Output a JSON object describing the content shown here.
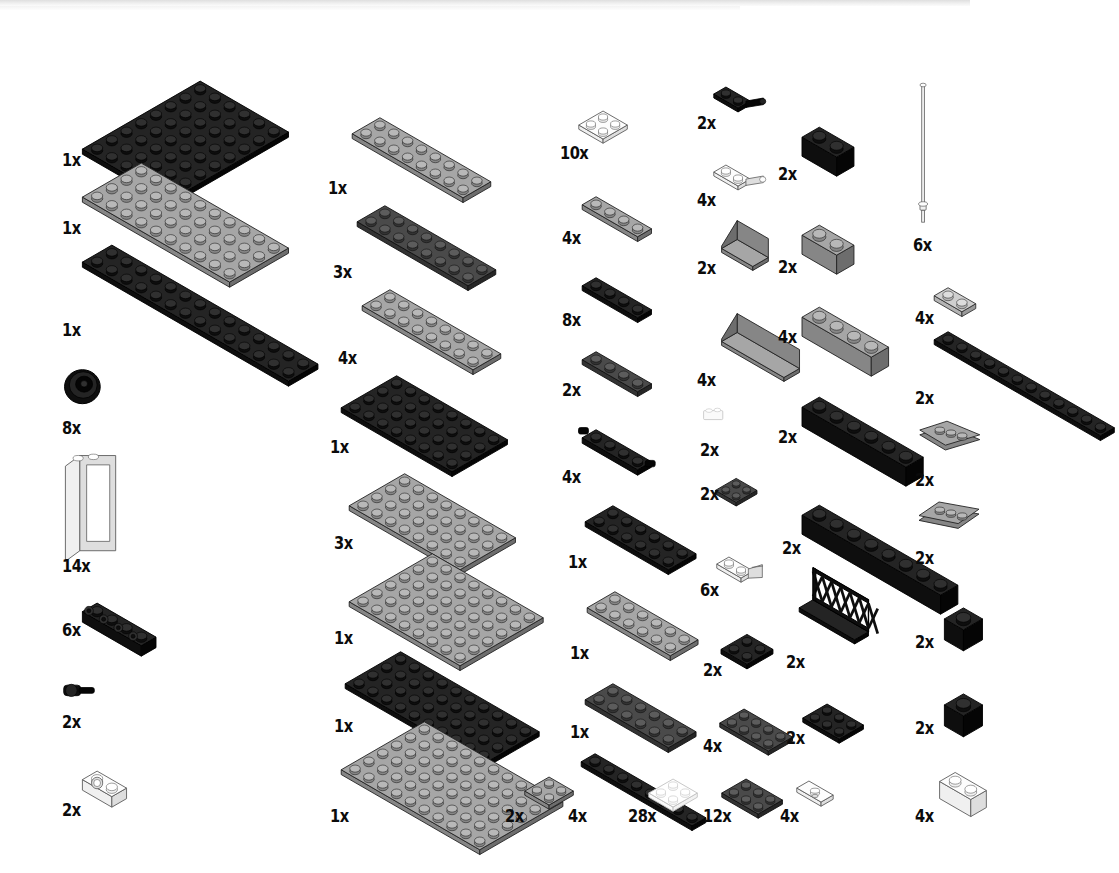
{
  "document": {
    "type": "lego-instruction-parts-inventory",
    "page_background": "#ffffff",
    "ink_color": "#0b0b0b",
    "quantity_suffix": "x",
    "columns_count": 6,
    "total_distinct_parts": 47
  },
  "palette": {
    "black": "#101010",
    "dark_gray": "#3b3b3b",
    "gray": "#8f8f8f",
    "light_gray": "#bdbdbd",
    "white": "#f7f7f7",
    "transparent": "#fbfbfb"
  },
  "columns": [
    {
      "id": "column-1",
      "x": 60,
      "parts": [
        {
          "id": "p1-1",
          "qty": "1x",
          "label_x": 62,
          "label_y": 150,
          "shape": "plate",
          "color": "black",
          "studs_w": 6,
          "studs_d": 8,
          "unit": 17,
          "art_x": 62,
          "art_y": 58,
          "desc": "plate 6x8 black"
        },
        {
          "id": "p1-2",
          "qty": "1x",
          "label_x": 62,
          "label_y": 218,
          "shape": "plate",
          "color": "gray",
          "studs_w": 10,
          "studs_d": 4,
          "unit": 17,
          "art_x": 62,
          "art_y": 140,
          "desc": "plate 4x10 gray"
        },
        {
          "id": "p1-3",
          "qty": "1x",
          "label_x": 62,
          "label_y": 320,
          "shape": "plate",
          "color": "black",
          "studs_w": 14,
          "studs_d": 2,
          "unit": 17,
          "art_x": 62,
          "art_y": 222,
          "desc": "plate 2x14 black"
        },
        {
          "id": "p1-4",
          "qty": "8x",
          "label_x": 62,
          "label_y": 418,
          "shape": "wheel",
          "color": "black",
          "unit": 17,
          "art_x": 62,
          "art_y": 368,
          "desc": "tire / wheel black"
        },
        {
          "id": "p1-5",
          "qty": "14x",
          "label_x": 62,
          "label_y": 556,
          "shape": "window",
          "color": "white",
          "unit": 17,
          "art_x": 62,
          "art_y": 452,
          "desc": "window frame 1x2x3 white"
        },
        {
          "id": "p1-6",
          "qty": "6x",
          "label_x": 62,
          "label_y": 620,
          "shape": "sidebrick",
          "color": "black",
          "unit": 17,
          "art_x": 62,
          "art_y": 580,
          "desc": "brick 1x4 with studs on side black"
        },
        {
          "id": "p1-7",
          "qty": "2x",
          "label_x": 62,
          "label_y": 712,
          "shape": "pin",
          "color": "black",
          "unit": 17,
          "art_x": 62,
          "art_y": 678,
          "desc": "technic pin black"
        },
        {
          "id": "p1-8",
          "qty": "2x",
          "label_x": 62,
          "label_y": 800,
          "shape": "holebrick",
          "color": "white",
          "unit": 17,
          "art_x": 62,
          "art_y": 748,
          "desc": "brick 1x2 with hole white"
        }
      ]
    },
    {
      "id": "column-2",
      "x": 325,
      "parts": [
        {
          "id": "p2-1",
          "qty": "1x",
          "label_x": 328,
          "label_y": 178,
          "shape": "plate",
          "color": "gray",
          "studs_w": 8,
          "studs_d": 2,
          "unit": 16,
          "art_x": 333,
          "art_y": 96,
          "desc": "plate 2x8 gray"
        },
        {
          "id": "p2-2",
          "qty": "3x",
          "label_x": 333,
          "label_y": 262,
          "shape": "plate",
          "color": "dark_gray",
          "studs_w": 8,
          "studs_d": 2,
          "unit": 16,
          "art_x": 338,
          "art_y": 184,
          "desc": "plate 2x8 dark gray"
        },
        {
          "id": "p2-3",
          "qty": "4x",
          "label_x": 338,
          "label_y": 348,
          "shape": "plate",
          "color": "gray",
          "studs_w": 8,
          "studs_d": 2,
          "unit": 16,
          "art_x": 343,
          "art_y": 268,
          "desc": "plate 2x8 gray"
        },
        {
          "id": "p2-4",
          "qty": "1x",
          "label_x": 330,
          "label_y": 437,
          "shape": "plate",
          "color": "black",
          "studs_w": 8,
          "studs_d": 4,
          "unit": 16,
          "art_x": 322,
          "art_y": 354,
          "desc": "plate 4x8 black"
        },
        {
          "id": "p2-5",
          "qty": "3x",
          "label_x": 334,
          "label_y": 533,
          "shape": "plate",
          "color": "gray",
          "studs_w": 8,
          "studs_d": 4,
          "unit": 16,
          "art_x": 330,
          "art_y": 452,
          "desc": "plate 4x8 gray"
        },
        {
          "id": "p2-6",
          "qty": "1x",
          "label_x": 334,
          "label_y": 628,
          "shape": "plate",
          "color": "gray",
          "studs_w": 8,
          "studs_d": 6,
          "unit": 16,
          "art_x": 330,
          "art_y": 532,
          "desc": "plate 6x8 gray"
        },
        {
          "id": "p2-7",
          "qty": "1x",
          "label_x": 334,
          "label_y": 716,
          "shape": "plate",
          "color": "black",
          "studs_w": 10,
          "studs_d": 4,
          "unit": 16,
          "art_x": 326,
          "art_y": 630,
          "desc": "plate 4x10 black"
        },
        {
          "id": "p2-8",
          "qty": "1x",
          "label_x": 330,
          "label_y": 806,
          "shape": "plate",
          "color": "gray",
          "studs_w": 10,
          "studs_d": 6,
          "unit": 16,
          "art_x": 322,
          "art_y": 700,
          "desc": "plate 6x10 gray"
        },
        {
          "id": "p2-9",
          "qty": "2x",
          "label_x": 505,
          "label_y": 806,
          "shape": "plate",
          "color": "gray",
          "studs_w": 2,
          "studs_d": 2,
          "unit": 14,
          "art_x": 508,
          "art_y": 758,
          "desc": "plate 2x2 gray"
        }
      ]
    },
    {
      "id": "column-3",
      "x": 560,
      "parts": [
        {
          "id": "p3-1",
          "qty": "10x",
          "label_x": 560,
          "label_y": 143,
          "shape": "plate",
          "color": "white",
          "studs_w": 2,
          "studs_d": 2,
          "unit": 14,
          "art_x": 562,
          "art_y": 92,
          "desc": "plate 2x2 white"
        },
        {
          "id": "p3-2",
          "qty": "4x",
          "label_x": 562,
          "label_y": 228,
          "shape": "plate",
          "color": "gray",
          "studs_w": 4,
          "studs_d": 1,
          "unit": 16,
          "art_x": 563,
          "art_y": 175,
          "desc": "plate 1x4 gray"
        },
        {
          "id": "p3-3",
          "qty": "8x",
          "label_x": 562,
          "label_y": 310,
          "shape": "plate",
          "color": "black",
          "studs_w": 4,
          "studs_d": 1,
          "unit": 16,
          "art_x": 563,
          "art_y": 256,
          "desc": "plate 1x4 black"
        },
        {
          "id": "p3-4",
          "qty": "2x",
          "label_x": 562,
          "label_y": 380,
          "shape": "plate",
          "color": "dark_gray",
          "studs_w": 4,
          "studs_d": 1,
          "unit": 16,
          "art_x": 563,
          "art_y": 330,
          "desc": "plate 1x4 dark gray"
        },
        {
          "id": "p3-5",
          "qty": "4x",
          "label_x": 562,
          "label_y": 467,
          "shape": "pinplate",
          "color": "black",
          "studs_w": 4,
          "studs_d": 1,
          "unit": 16,
          "art_x": 563,
          "art_y": 408,
          "desc": "plate 1x4 with pins black"
        },
        {
          "id": "p3-6",
          "qty": "1x",
          "label_x": 568,
          "label_y": 552,
          "shape": "plate",
          "color": "black",
          "studs_w": 6,
          "studs_d": 2,
          "unit": 16,
          "art_x": 566,
          "art_y": 484,
          "desc": "plate 2x6 black"
        },
        {
          "id": "p3-7",
          "qty": "1x",
          "label_x": 570,
          "label_y": 643,
          "shape": "plate",
          "color": "gray",
          "studs_w": 6,
          "studs_d": 2,
          "unit": 16,
          "art_x": 568,
          "art_y": 570,
          "desc": "plate 2x6 gray"
        },
        {
          "id": "p3-8",
          "qty": "1x",
          "label_x": 570,
          "label_y": 722,
          "shape": "plate",
          "color": "dark_gray",
          "studs_w": 6,
          "studs_d": 2,
          "unit": 16,
          "art_x": 566,
          "art_y": 662,
          "desc": "plate 2x6 dark gray"
        },
        {
          "id": "p3-9",
          "qty": "4x",
          "label_x": 568,
          "label_y": 806,
          "shape": "plate",
          "color": "black",
          "studs_w": 8,
          "studs_d": 1,
          "unit": 16,
          "art_x": 562,
          "art_y": 732,
          "desc": "plate 1x8 black"
        },
        {
          "id": "p3-10",
          "qty": "28x",
          "label_x": 628,
          "label_y": 806,
          "shape": "plate",
          "color": "transparent",
          "studs_w": 2,
          "studs_d": 2,
          "unit": 14,
          "art_x": 632,
          "art_y": 760,
          "desc": "plate 2x2 transparent"
        }
      ]
    },
    {
      "id": "column-4",
      "x": 690,
      "parts": [
        {
          "id": "p4-1",
          "qty": "2x",
          "label_x": 697,
          "label_y": 113,
          "shape": "hingeplate",
          "color": "black",
          "unit": 14,
          "art_x": 697,
          "art_y": 68,
          "desc": "plate 1x2 with clip black"
        },
        {
          "id": "p4-2",
          "qty": "4x",
          "label_x": 697,
          "label_y": 190,
          "shape": "hingeplate",
          "color": "white",
          "unit": 14,
          "art_x": 697,
          "art_y": 146,
          "desc": "plate 1x2 with clip white"
        },
        {
          "id": "p4-3",
          "qty": "2x",
          "label_x": 697,
          "label_y": 258,
          "shape": "panel",
          "color": "gray",
          "width": 2,
          "unit": 18,
          "art_x": 700,
          "art_y": 215,
          "desc": "panel 1x2x1 gray"
        },
        {
          "id": "p4-4",
          "qty": "4x",
          "label_x": 697,
          "label_y": 370,
          "shape": "panel",
          "color": "gray",
          "width": 4,
          "unit": 18,
          "art_x": 700,
          "art_y": 308,
          "desc": "panel 1x4x1 gray"
        },
        {
          "id": "p4-5",
          "qty": "2x",
          "label_x": 700,
          "label_y": 440,
          "shape": "tinytrans",
          "color": "transparent",
          "unit": 12,
          "art_x": 700,
          "art_y": 404,
          "desc": "small transparent part"
        },
        {
          "id": "p4-6",
          "qty": "2x",
          "label_x": 700,
          "label_y": 484,
          "shape": "plate",
          "color": "dark_gray",
          "studs_w": 2,
          "studs_d": 2,
          "unit": 12,
          "art_x": 701,
          "art_y": 462,
          "desc": "plate 2x2 dark gray"
        },
        {
          "id": "p4-7",
          "qty": "6x",
          "label_x": 700,
          "label_y": 580,
          "shape": "clipplate",
          "color": "white",
          "unit": 14,
          "art_x": 700,
          "art_y": 538,
          "desc": "plate 1x2 with handle white"
        },
        {
          "id": "p4-8",
          "qty": "2x",
          "label_x": 703,
          "label_y": 660,
          "shape": "plate",
          "color": "black",
          "studs_w": 2,
          "studs_d": 2,
          "unit": 15,
          "art_x": 703,
          "art_y": 614,
          "desc": "plate 2x2 black"
        },
        {
          "id": "p4-9",
          "qty": "4x",
          "label_x": 703,
          "label_y": 736,
          "shape": "plate",
          "color": "dark_gray",
          "studs_w": 4,
          "studs_d": 2,
          "unit": 14,
          "art_x": 703,
          "art_y": 690,
          "desc": "plate 2x4 dark gray"
        },
        {
          "id": "p4-10",
          "qty": "12x",
          "label_x": 703,
          "label_y": 806,
          "shape": "plate",
          "color": "dark_gray",
          "studs_w": 3,
          "studs_d": 2,
          "unit": 14,
          "art_x": 705,
          "art_y": 760,
          "desc": "plate 2x3 dark gray"
        }
      ]
    },
    {
      "id": "column-5",
      "x": 775,
      "parts": [
        {
          "id": "p5-1",
          "qty": "2x",
          "label_x": 778,
          "label_y": 164,
          "shape": "brick",
          "color": "black",
          "studs_w": 2,
          "studs_d": 1,
          "unit": 20,
          "art_x": 778,
          "art_y": 100,
          "desc": "brick 1x2 black"
        },
        {
          "id": "p5-2",
          "qty": "2x",
          "label_x": 778,
          "label_y": 257,
          "shape": "brick",
          "color": "gray",
          "studs_w": 2,
          "studs_d": 1,
          "unit": 20,
          "art_x": 778,
          "art_y": 198,
          "desc": "brick 1x2 gray"
        },
        {
          "id": "p5-3",
          "qty": "4x",
          "label_x": 778,
          "label_y": 327,
          "shape": "brick",
          "color": "gray",
          "studs_w": 4,
          "studs_d": 1,
          "unit": 20,
          "art_x": 778,
          "art_y": 280,
          "desc": "brick 1x4 gray"
        },
        {
          "id": "p5-4",
          "qty": "2x",
          "label_x": 778,
          "label_y": 427,
          "shape": "brick",
          "color": "black",
          "studs_w": 6,
          "studs_d": 1,
          "unit": 20,
          "art_x": 778,
          "art_y": 370,
          "desc": "brick 1x6 black"
        },
        {
          "id": "p5-5",
          "qty": "2x",
          "label_x": 782,
          "label_y": 538,
          "shape": "brick",
          "color": "black",
          "studs_w": 8,
          "studs_d": 1,
          "unit": 20,
          "art_x": 778,
          "art_y": 478,
          "desc": "brick 1x8 black"
        },
        {
          "id": "p5-6",
          "qty": "2x",
          "label_x": 786,
          "label_y": 652,
          "shape": "fence",
          "color": "black",
          "unit": 16,
          "art_x": 780,
          "art_y": 578,
          "desc": "lattice fence 1x4x2 black"
        },
        {
          "id": "p5-7",
          "qty": "2x",
          "label_x": 786,
          "label_y": 728,
          "shape": "plate",
          "color": "black",
          "studs_w": 3,
          "studs_d": 2,
          "unit": 14,
          "art_x": 786,
          "art_y": 685,
          "desc": "plate 2x3 black"
        },
        {
          "id": "p5-8",
          "qty": "4x",
          "label_x": 780,
          "label_y": 806,
          "shape": "jumper",
          "color": "white",
          "unit": 14,
          "art_x": 780,
          "art_y": 762,
          "desc": "plate 1x2 with single stud white"
        }
      ]
    },
    {
      "id": "column-6",
      "x": 910,
      "parts": [
        {
          "id": "p6-1",
          "qty": "6x",
          "label_x": 913,
          "label_y": 235,
          "shape": "antenna",
          "color": "white",
          "unit": 14,
          "art_x": 913,
          "art_y": 78,
          "desc": "antenna / flag pole white"
        },
        {
          "id": "p6-2",
          "qty": "4x",
          "label_x": 915,
          "label_y": 308,
          "shape": "plate",
          "color": "light_gray",
          "studs_w": 2,
          "studs_d": 1,
          "unit": 16,
          "art_x": 915,
          "art_y": 266,
          "desc": "plate 1x2 light gray"
        },
        {
          "id": "p6-3",
          "qty": "2x",
          "label_x": 915,
          "label_y": 388,
          "shape": "plate",
          "color": "black",
          "studs_w": 12,
          "studs_d": 1,
          "unit": 16,
          "art_x": 915,
          "art_y": 310,
          "desc": "plate 1x12 black"
        },
        {
          "id": "p6-4",
          "qty": "2x",
          "label_x": 915,
          "label_y": 470,
          "shape": "wedge",
          "color": "gray",
          "unit": 16,
          "art_x": 915,
          "art_y": 414,
          "desc": "wedge plate 2x3 right gray"
        },
        {
          "id": "p6-5",
          "qty": "2x",
          "label_x": 915,
          "label_y": 548,
          "shape": "wedge",
          "color": "gray",
          "unit": 16,
          "art_x": 915,
          "art_y": 494,
          "desc": "wedge plate 2x3 left gray"
        },
        {
          "id": "p6-6",
          "qty": "2x",
          "label_x": 915,
          "label_y": 632,
          "shape": "brick",
          "color": "black",
          "studs_w": 1,
          "studs_d": 1,
          "unit": 22,
          "art_x": 918,
          "art_y": 578,
          "desc": "brick 1x1 black"
        },
        {
          "id": "p6-7",
          "qty": "2x",
          "label_x": 915,
          "label_y": 718,
          "shape": "brick",
          "color": "black",
          "studs_w": 1,
          "studs_d": 1,
          "unit": 22,
          "art_x": 918,
          "art_y": 664,
          "desc": "brick 1x1 black"
        },
        {
          "id": "p6-8",
          "qty": "4x",
          "label_x": 915,
          "label_y": 806,
          "shape": "brick",
          "color": "white",
          "studs_w": 2,
          "studs_d": 1,
          "unit": 18,
          "art_x": 918,
          "art_y": 748,
          "desc": "brick 1x2 white"
        }
      ]
    }
  ]
}
